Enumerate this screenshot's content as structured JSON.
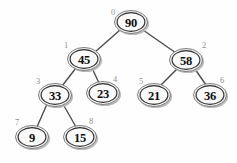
{
  "diagram": {
    "node_count": 9,
    "background_color": "#fefefe",
    "node_fill_color": "#fafafa",
    "node_border_color": "#2b2b2b",
    "edge_color": "#4a4a4a",
    "index_label_color": "#8e8e8e",
    "value_text_color": "#0d0d0d"
  },
  "nodes": [
    {
      "index": "0",
      "value": "90",
      "cx": 131,
      "cy": 22,
      "rx": 16.5,
      "ry": 11.5,
      "ix": 113,
      "iy": 12
    },
    {
      "index": "1",
      "value": "45",
      "cx": 84,
      "cy": 59,
      "rx": 16.5,
      "ry": 11.5,
      "ix": 66,
      "iy": 45
    },
    {
      "index": "2",
      "value": "58",
      "cx": 186,
      "cy": 60,
      "rx": 16.5,
      "ry": 11.5,
      "ix": 204,
      "iy": 45
    },
    {
      "index": "3",
      "value": "33",
      "cx": 55,
      "cy": 95,
      "rx": 16.5,
      "ry": 11.5,
      "ix": 38,
      "iy": 81
    },
    {
      "index": "4",
      "value": "23",
      "cx": 103,
      "cy": 93,
      "rx": 16.5,
      "ry": 11.5,
      "ix": 115,
      "iy": 79
    },
    {
      "index": "5",
      "value": "21",
      "cx": 154,
      "cy": 95,
      "rx": 16.5,
      "ry": 11.5,
      "ix": 141,
      "iy": 81
    },
    {
      "index": "6",
      "value": "36",
      "cx": 210,
      "cy": 95,
      "rx": 16.5,
      "ry": 11.5,
      "ix": 222,
      "iy": 80
    },
    {
      "index": "7",
      "value": "9",
      "cx": 32,
      "cy": 137,
      "rx": 16.5,
      "ry": 11.5,
      "ix": 17,
      "iy": 122
    },
    {
      "index": "8",
      "value": "15",
      "cx": 80,
      "cy": 137,
      "rx": 16.5,
      "ry": 11.5,
      "ix": 91,
      "iy": 121
    }
  ],
  "edges": [
    {
      "from": "0",
      "to": "1",
      "x1": 120,
      "y1": 30,
      "x2": 95,
      "y2": 52
    },
    {
      "from": "0",
      "to": "2",
      "x1": 143,
      "y1": 30,
      "x2": 176,
      "y2": 53
    },
    {
      "from": "1",
      "to": "3",
      "x1": 76,
      "y1": 68,
      "x2": 62,
      "y2": 86
    },
    {
      "from": "1",
      "to": "4",
      "x1": 92,
      "y1": 68,
      "x2": 99,
      "y2": 83
    },
    {
      "from": "2",
      "to": "5",
      "x1": 177,
      "y1": 69,
      "x2": 160,
      "y2": 86
    },
    {
      "from": "2",
      "to": "6",
      "x1": 195,
      "y1": 69,
      "x2": 206,
      "y2": 85
    },
    {
      "from": "3",
      "to": "7",
      "x1": 47,
      "y1": 104,
      "x2": 37,
      "y2": 127
    },
    {
      "from": "3",
      "to": "8",
      "x1": 63,
      "y1": 104,
      "x2": 76,
      "y2": 127
    }
  ]
}
